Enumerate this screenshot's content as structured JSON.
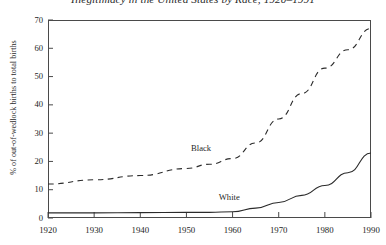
{
  "chart_data": {
    "type": "line",
    "title": "Illegitimacy in the United States by Race, 1920–1991",
    "xlabel": "",
    "ylabel": "% of out-of-wedlock births to total births",
    "xlim": [
      1920,
      1990
    ],
    "ylim": [
      0,
      70
    ],
    "grid": false,
    "legend_position": "inline-annotation",
    "xticks": [
      1920,
      1930,
      1940,
      1950,
      1960,
      1970,
      1980,
      1990
    ],
    "xtick_labels": [
      "1920",
      "1930",
      "1940",
      "1950",
      "1960",
      "1970",
      "1980",
      "1990"
    ],
    "yticks": [
      0,
      10,
      20,
      30,
      40,
      50,
      60,
      70
    ],
    "ytick_labels": [
      "0",
      "10",
      "20",
      "30",
      "40",
      "50",
      "60",
      "70"
    ],
    "x": [
      1920,
      1930,
      1940,
      1950,
      1955,
      1960,
      1965,
      1970,
      1975,
      1980,
      1985,
      1990
    ],
    "series": [
      {
        "name": "Black",
        "style": "dashed",
        "color": "#2b2b2b",
        "values": [
          12.0,
          13.5,
          15.0,
          17.5,
          19.0,
          21.0,
          26.5,
          35.0,
          44.0,
          53.0,
          59.5,
          67.0
        ]
      },
      {
        "name": "White",
        "style": "solid",
        "color": "#2b2b2b",
        "values": [
          1.8,
          1.8,
          1.9,
          2.0,
          2.0,
          2.2,
          3.5,
          5.5,
          8.0,
          11.5,
          16.0,
          23.0
        ]
      }
    ],
    "annotations": [
      {
        "text": "Black",
        "x": 1951,
        "y": 24.5
      },
      {
        "text": "White",
        "x": 1957,
        "y": 7.2
      }
    ]
  }
}
